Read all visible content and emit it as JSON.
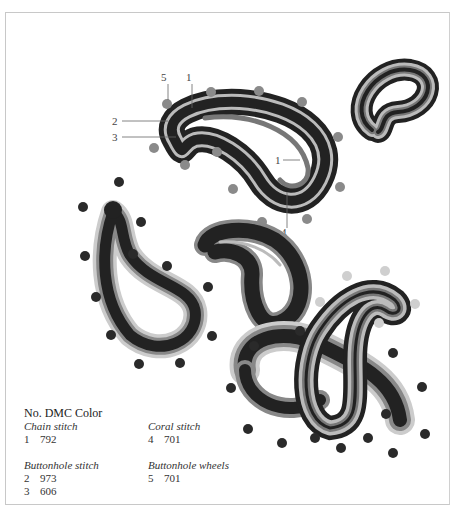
{
  "figure": {
    "callouts": [
      {
        "id": "5",
        "label": "5"
      },
      {
        "id": "1a",
        "label": "1"
      },
      {
        "id": "2",
        "label": "2"
      },
      {
        "id": "3",
        "label": "3"
      },
      {
        "id": "1b",
        "label": "1"
      },
      {
        "id": "4",
        "label": "4"
      }
    ],
    "colors": {
      "dark": "#222222",
      "mid": "#777777",
      "light": "#bbbbbb",
      "dot_dark": "#2a2a2a",
      "dot_mid": "#8a8a8a",
      "dot_light": "#cfcfcf"
    }
  },
  "legend": {
    "header": "No. DMC Color",
    "groups": [
      {
        "title": "Chain stitch",
        "rows": [
          {
            "no": "1",
            "color": "792"
          }
        ]
      },
      {
        "title": "Coral stitch",
        "rows": [
          {
            "no": "4",
            "color": "701"
          }
        ]
      },
      {
        "title": "Buttonhole stitch",
        "rows": [
          {
            "no": "2",
            "color": "973"
          },
          {
            "no": "3",
            "color": "606"
          }
        ]
      },
      {
        "title": "Buttonhole wheels",
        "rows": [
          {
            "no": "5",
            "color": "701"
          }
        ]
      }
    ]
  }
}
